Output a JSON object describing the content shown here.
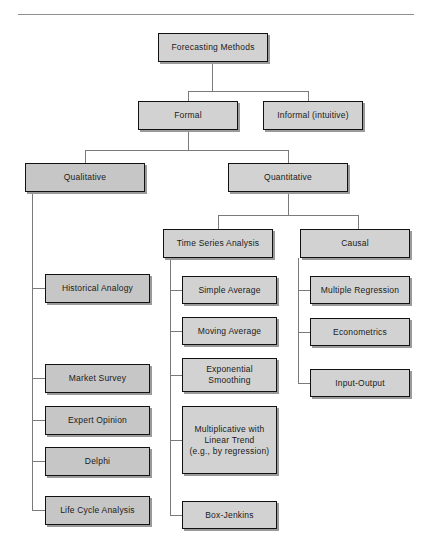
{
  "figure": {
    "title_rule": true,
    "colors": {
      "box_fill": "#d2d2d2",
      "box_fill_dark": "#c6c6c6",
      "box_border": "#111111",
      "shadow": "#9a9a9a",
      "connector": "#7a7a7a",
      "rule": "#8e8e8e",
      "text": "#1a1a1a",
      "background": "#ffffff"
    }
  },
  "nodes": {
    "root": {
      "label": "Forecasting Methods"
    },
    "formal": {
      "label": "Formal"
    },
    "informal": {
      "label": "Informal (intuitive)"
    },
    "qualitative": {
      "label": "Qualitative"
    },
    "quantitative": {
      "label": "Quantitative"
    },
    "time_series": {
      "label": "Time Series Analysis"
    },
    "causal": {
      "label": "Causal"
    },
    "historical_analogy": {
      "label": "Historical  Analogy"
    },
    "market_survey": {
      "label": "Market Survey"
    },
    "expert_opinion": {
      "label": "Expert Opinion"
    },
    "delphi": {
      "label": "Delphi"
    },
    "life_cycle_analysis": {
      "label": "Life Cycle Analysis"
    },
    "simple_average": {
      "label": "Simple Average"
    },
    "moving_average": {
      "label": "Moving Average"
    },
    "exponential_smoothing": {
      "label": "Exponential\nSmoothing"
    },
    "multiplicative_linear_trend": {
      "label": "Multiplicative with\nLinear Trend\n(e.g., by regression)"
    },
    "box_jenkins": {
      "label": "Box-Jenkins"
    },
    "multiple_regression": {
      "label": "Multiple Regression"
    },
    "econometrics": {
      "label": "Econometrics"
    },
    "input_output": {
      "label": "Input-Output"
    }
  }
}
